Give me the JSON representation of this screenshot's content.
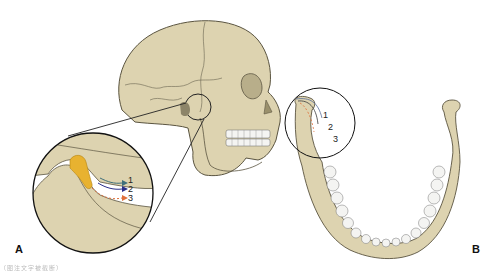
{
  "figure": {
    "panels": [
      {
        "id": "A",
        "label": "A",
        "view": "lateral skull with magnified TMJ inset",
        "path_labels": [
          "1",
          "2",
          "3"
        ],
        "path_colors": [
          "#3f6f7a",
          "#2a2f8a",
          "#e0703a"
        ],
        "path_styles": [
          "solid",
          "solid",
          "dashed"
        ]
      },
      {
        "id": "B",
        "label": "B",
        "view": "superior view of mandible with condyle inset",
        "path_labels": [
          "1",
          "2",
          "3"
        ],
        "path_colors": [
          "#5a6e9a",
          "#3a3a3a",
          "#e0703a"
        ],
        "path_styles": [
          "solid",
          "solid",
          "dashed"
        ]
      }
    ],
    "colors": {
      "bone": "#ddd3b0",
      "bone_outline": "#5a5440",
      "disc": "#e8b230",
      "tooth": "#f4f4f2",
      "line": "#222222"
    },
    "caption": "（图注文字被截断）"
  }
}
